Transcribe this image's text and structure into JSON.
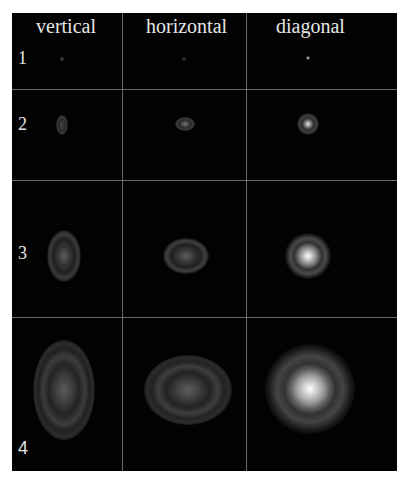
{
  "columns": [
    {
      "label": "vertical"
    },
    {
      "label": "horizontal"
    },
    {
      "label": "diagonal"
    }
  ],
  "rows": [
    {
      "label": "1"
    },
    {
      "label": "2"
    },
    {
      "label": "3"
    },
    {
      "label": "4"
    }
  ],
  "colors": {
    "background": "#020202",
    "grid_line": "#7a7a7a",
    "text": "#e6e6e6",
    "margin": "#ffffff"
  }
}
